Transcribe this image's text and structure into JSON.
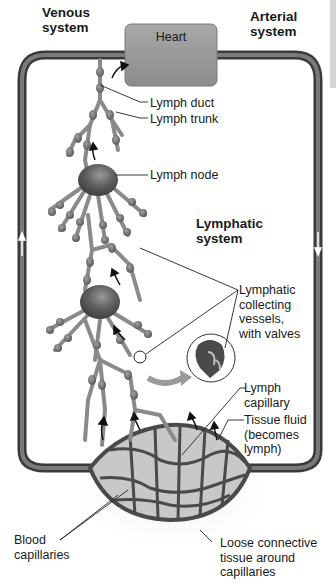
{
  "figure": {
    "style": "grayscale illustration"
  },
  "headings": {
    "venous": "Venous\nsystem",
    "arterial": "Arterial\nsystem",
    "lymphatic": "Lymphatic\nsystem"
  },
  "heart": {
    "label": "Heart"
  },
  "labels": {
    "lymph_duct": "Lymph duct",
    "lymph_trunk": "Lymph trunk",
    "lymph_node": "Lymph node",
    "collecting_vessels": "Lymphatic\ncollecting\nvessels,\nwith valves",
    "lymph_capillary": "Lymph\ncapillary",
    "tissue_fluid": "Tissue fluid\n(becomes\nlymph)",
    "blood_capillaries": "Blood\ncapillaries",
    "loose_connective": "Loose connective\ntissue around\ncapillaries"
  },
  "colors": {
    "vessel": "#6a6a6a",
    "vessel_dark": "#3a3a3a",
    "node": "#5a5a5a",
    "heart_box": "#9a9a9a",
    "text": "#1a1a1a"
  }
}
